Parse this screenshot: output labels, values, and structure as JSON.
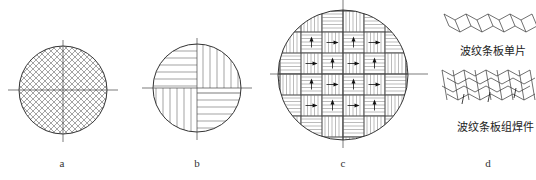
{
  "figure": {
    "panels": [
      {
        "id": "a",
        "label": "a",
        "pattern": "crosshatch"
      },
      {
        "id": "b",
        "label": "b",
        "pattern": "quadrant-lines"
      },
      {
        "id": "c",
        "label": "c",
        "pattern": "checkerboard-with-arrows"
      },
      {
        "id": "d",
        "label": "d",
        "pattern": "corrugated-strips",
        "captions": {
          "single": "波纹条板单片",
          "assembly": "波纹条板组焊件"
        }
      }
    ],
    "colors": {
      "line": "#333333",
      "hatch": "#555555",
      "background": "#ffffff"
    }
  }
}
